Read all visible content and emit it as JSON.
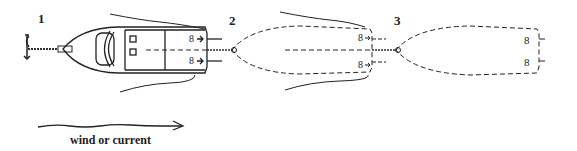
{
  "diagram": {
    "labels": {
      "step1": "1",
      "step2": "2",
      "step3": "3"
    },
    "legend": {
      "caption": "wind or current",
      "arrow_icon": "wavy-right-arrow"
    },
    "elements": [
      {
        "id": "anchor",
        "icon": "anchor-icon",
        "desc": "Anchor with chain at bow"
      },
      {
        "id": "boat-1",
        "desc": "Solid boat outline, stern-to-stern tow start"
      },
      {
        "id": "boat-2",
        "desc": "Dashed boat outline with twin propellers"
      },
      {
        "id": "boat-3",
        "desc": "Dashed boat outline with twin propellers"
      }
    ],
    "colors": {
      "stroke": "#222222",
      "background": "#ffffff"
    }
  }
}
